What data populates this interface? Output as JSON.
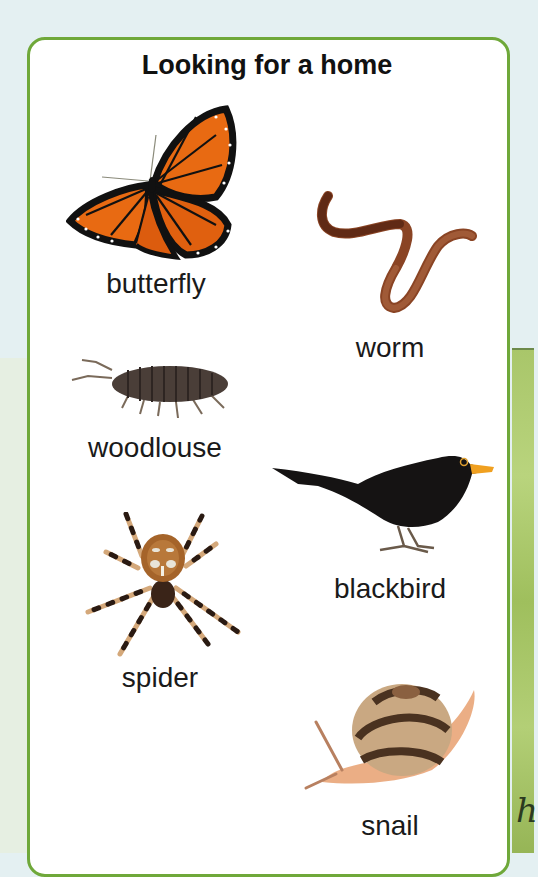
{
  "page": {
    "title": "Looking for a home"
  },
  "animals": [
    {
      "name": "butterfly",
      "icon": "butterfly-icon"
    },
    {
      "name": "worm",
      "icon": "worm-icon"
    },
    {
      "name": "woodlouse",
      "icon": "woodlouse-icon"
    },
    {
      "name": "blackbird",
      "icon": "blackbird-icon"
    },
    {
      "name": "spider",
      "icon": "spider-icon"
    },
    {
      "name": "snail",
      "icon": "snail-icon"
    }
  ],
  "margin_scribble": "h",
  "colors": {
    "card_border": "#6fa83a",
    "card_bg": "#ffffff",
    "page_bg": "#e4f0f2",
    "grass": "#a9c66a"
  }
}
